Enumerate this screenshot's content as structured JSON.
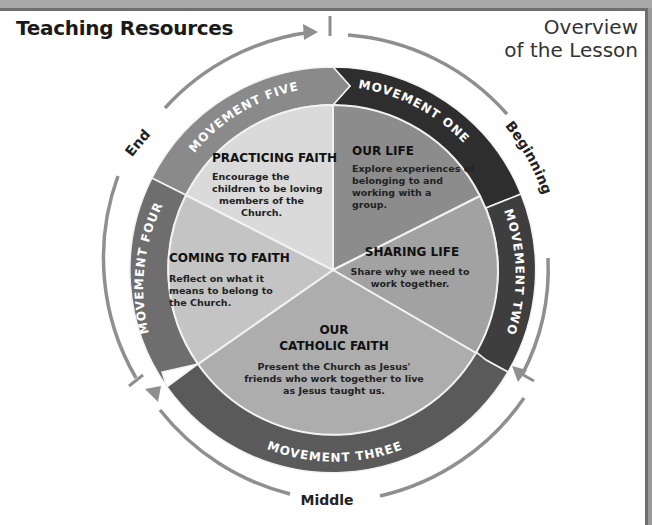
{
  "header": {
    "title": "Teaching Resources",
    "overview_line1": "Overview",
    "overview_line2": "of the Lesson"
  },
  "phases": {
    "beginning": "Beginning",
    "middle": "Middle",
    "end": "End"
  },
  "movements": [
    {
      "label": "MOVEMENT ONE",
      "color": "#2e2e2e"
    },
    {
      "label": "MOVEMENT TWO",
      "color": "#3e3e3e"
    },
    {
      "label": "MOVEMENT THREE",
      "color": "#5a5a5a"
    },
    {
      "label": "MOVEMENT FOUR",
      "color": "#6e6e6e"
    },
    {
      "label": "MOVEMENT FIVE",
      "color": "#8a8a8a"
    }
  ],
  "sections": [
    {
      "title": "OUR LIFE",
      "lines": [
        "Explore experiences of",
        "belonging to and",
        "working with a",
        "group."
      ],
      "color": "#8c8c8c"
    },
    {
      "title": "SHARING LIFE",
      "lines": [
        "Share why we need to",
        "work together."
      ],
      "color": "#a2a2a2"
    },
    {
      "title_line1": "OUR",
      "title_line2": "CATHOLIC FAITH",
      "lines": [
        "Present the Church as Jesus'",
        "friends who work together to live",
        "as Jesus taught us."
      ],
      "color": "#adadad"
    },
    {
      "title": "COMING TO FAITH",
      "lines": [
        "Reflect on what it",
        "means to belong to",
        "the Church."
      ],
      "color": "#c4c4c4"
    },
    {
      "title": "PRACTICING FAITH",
      "lines": [
        "Encourage the",
        "children to be loving",
        "members of the",
        "Church."
      ],
      "color": "#dadada"
    }
  ],
  "colors": {
    "arc": "#8f8f8f",
    "divider": "#f2f2f2",
    "text": "#111111"
  }
}
